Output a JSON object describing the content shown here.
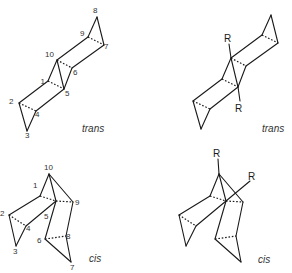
{
  "figure": {
    "panels": [
      {
        "id": "trans-numbered",
        "caption": "trans",
        "atom_labels": [
          "1",
          "2",
          "3",
          "4",
          "5",
          "6",
          "7",
          "8",
          "9",
          "10"
        ]
      },
      {
        "id": "trans-substituted",
        "caption": "trans",
        "substituents": [
          "R",
          "R"
        ]
      },
      {
        "id": "cis-numbered",
        "caption": "cis",
        "atom_labels": [
          "1",
          "2",
          "3",
          "4",
          "5",
          "6",
          "7",
          "8",
          "9",
          "10"
        ]
      },
      {
        "id": "cis-substituted",
        "caption": "cis",
        "substituents": [
          "R",
          "R"
        ]
      }
    ]
  }
}
